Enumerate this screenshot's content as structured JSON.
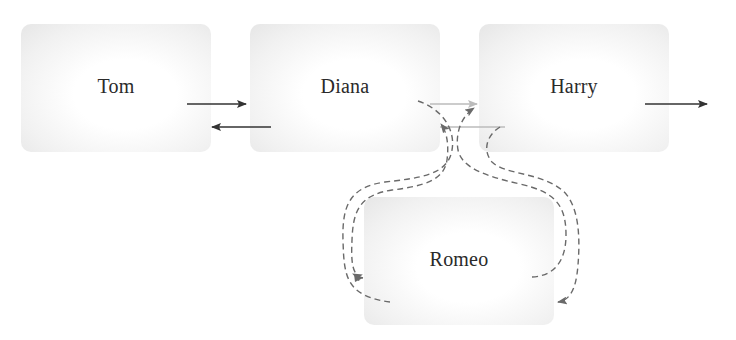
{
  "diagram": {
    "type": "linked-list-insertion",
    "nodes": [
      {
        "id": "tom",
        "label": "Tom",
        "x": 21,
        "y": 24,
        "w": 190,
        "h": 128
      },
      {
        "id": "diana",
        "label": "Diana",
        "x": 250,
        "y": 24,
        "w": 190,
        "h": 128
      },
      {
        "id": "harry",
        "label": "Harry",
        "x": 479,
        "y": 24,
        "w": 190,
        "h": 128
      },
      {
        "id": "romeo",
        "label": "Romeo",
        "x": 364,
        "y": 197,
        "w": 190,
        "h": 128
      }
    ],
    "links": [
      {
        "from": "tom",
        "to": "diana",
        "style": "solid",
        "color": "#333333",
        "direction": "next"
      },
      {
        "from": "diana",
        "to": "tom",
        "style": "solid",
        "color": "#333333",
        "direction": "prev"
      },
      {
        "from": "diana",
        "to": "harry",
        "style": "solid-faded",
        "color": "#bbbbbb",
        "direction": "next"
      },
      {
        "from": "harry",
        "to": "diana",
        "style": "solid-faded",
        "color": "#bbbbbb",
        "direction": "prev"
      },
      {
        "from": "harry",
        "to": "next",
        "style": "solid",
        "color": "#333333",
        "direction": "next"
      },
      {
        "from": "diana",
        "to": "romeo",
        "style": "dashed",
        "color": "#666666",
        "direction": "next"
      },
      {
        "from": "romeo",
        "to": "diana",
        "style": "dashed",
        "color": "#666666",
        "direction": "prev"
      },
      {
        "from": "romeo",
        "to": "harry",
        "style": "dashed",
        "color": "#666666",
        "direction": "next"
      },
      {
        "from": "harry",
        "to": "romeo",
        "style": "dashed",
        "color": "#666666",
        "direction": "prev"
      }
    ],
    "colors": {
      "solid_arrow": "#333333",
      "faded_arrow": "#bbbbbb",
      "dashed_arrow": "#6a6a6a",
      "node_text": "#2a2a2a"
    }
  }
}
